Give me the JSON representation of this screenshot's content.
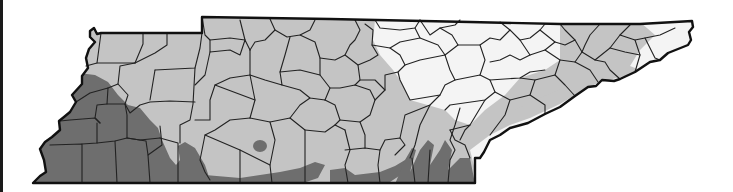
{
  "map": {
    "subject": "Tennessee county map",
    "zones": [
      {
        "name": "dark",
        "color": "#6e6e6e"
      },
      {
        "name": "medium",
        "color": "#c4c4c4"
      },
      {
        "name": "light",
        "color": "#f4f4f4"
      }
    ],
    "outline_color": "#111111",
    "county_line_color": "#222222",
    "background": "#ffffff"
  }
}
